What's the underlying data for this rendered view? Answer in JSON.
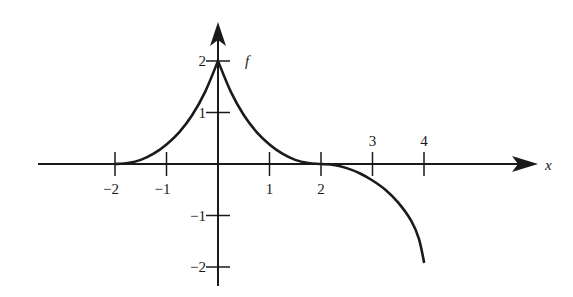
{
  "chart_data": {
    "type": "line",
    "title": "",
    "xlabel": "x",
    "ylabel": "f",
    "xlim": [
      -3.5,
      6.5
    ],
    "ylim": [
      -2.3,
      2.6
    ],
    "x_ticks": [
      -2,
      -1,
      1,
      2,
      3,
      4
    ],
    "x_tick_labels": [
      "−2",
      "−1",
      "1",
      "2",
      "3",
      "4"
    ],
    "y_ticks": [
      2,
      1,
      -1,
      -2
    ],
    "y_tick_labels": [
      "2",
      "1",
      "−1",
      "−2"
    ],
    "grid": false,
    "legend": null,
    "series": [
      {
        "name": "f",
        "description": "Cusp at (0,2); decreases to 0 at x=±2 with flat approach; zero for x<-2; decreases below axis for x>2, reaching about -1.9 at x=4 with a vertical tangent",
        "points": [
          [
            -3.5,
            0
          ],
          [
            -2,
            0
          ],
          [
            -1.75,
            0.02
          ],
          [
            -1.5,
            0.08
          ],
          [
            -1.25,
            0.2
          ],
          [
            -1,
            0.38
          ],
          [
            -0.75,
            0.62
          ],
          [
            -0.5,
            0.95
          ],
          [
            -0.25,
            1.4
          ],
          [
            0,
            2
          ],
          [
            0.25,
            1.4
          ],
          [
            0.5,
            0.95
          ],
          [
            0.75,
            0.62
          ],
          [
            1,
            0.38
          ],
          [
            1.25,
            0.2
          ],
          [
            1.5,
            0.08
          ],
          [
            1.75,
            0.02
          ],
          [
            2,
            0
          ],
          [
            2.25,
            -0.02
          ],
          [
            2.5,
            -0.08
          ],
          [
            2.75,
            -0.18
          ],
          [
            3,
            -0.32
          ],
          [
            3.25,
            -0.5
          ],
          [
            3.5,
            -0.75
          ],
          [
            3.75,
            -1.1
          ],
          [
            3.9,
            -1.45
          ],
          [
            4,
            -1.9
          ]
        ]
      }
    ]
  },
  "labels": {
    "x_axis": "x",
    "f_label": "f",
    "x_ticks": [
      "−2",
      "−1",
      "1",
      "2",
      "3",
      "4"
    ],
    "y_ticks": [
      "2",
      "1",
      "−1",
      "−2"
    ]
  }
}
